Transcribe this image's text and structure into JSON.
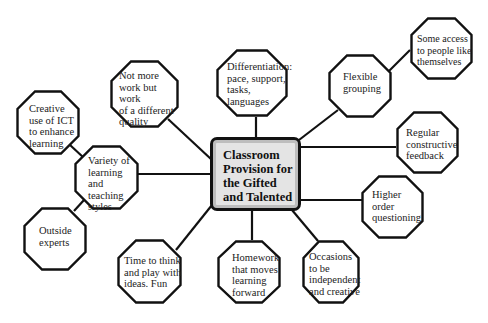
{
  "diagram": {
    "type": "mind-map",
    "center": {
      "lines": [
        "Classroom",
        "Provision for",
        "the Gifted",
        "and Talented"
      ]
    },
    "nodes": [
      {
        "id": "not-more-work",
        "lines": [
          "Not more",
          "work but work",
          "of a different",
          "quality"
        ]
      },
      {
        "id": "differentiation",
        "lines": [
          "Differentiation:",
          "pace, support,",
          "tasks,",
          "languages"
        ]
      },
      {
        "id": "flexible-grouping",
        "lines": [
          "Flexible",
          "grouping"
        ]
      },
      {
        "id": "some-access",
        "lines": [
          "Some access",
          "to people like",
          "themselves"
        ]
      },
      {
        "id": "regular-feedback",
        "lines": [
          "Regular",
          "constructive",
          "feedback"
        ]
      },
      {
        "id": "higher-order",
        "lines": [
          "Higher",
          "order",
          "questioning"
        ]
      },
      {
        "id": "occasions",
        "lines": [
          "Occasions",
          "to be",
          "independent",
          "and creative"
        ]
      },
      {
        "id": "homework",
        "lines": [
          "Homework",
          "that moves",
          "learning",
          "forward"
        ]
      },
      {
        "id": "time-to-think",
        "lines": [
          "Time to think",
          "and play with",
          "ideas. Fun"
        ]
      },
      {
        "id": "variety",
        "lines": [
          "Variety of",
          "learning and",
          "teaching",
          "styles"
        ]
      },
      {
        "id": "creative-ict",
        "lines": [
          "Creative",
          "use of ICT",
          "to enhance",
          "learning"
        ]
      },
      {
        "id": "outside-experts",
        "lines": [
          "Outside",
          "experts"
        ]
      }
    ],
    "connections": [
      [
        "center",
        "not-more-work"
      ],
      [
        "center",
        "differentiation"
      ],
      [
        "center",
        "flexible-grouping"
      ],
      [
        "flexible-grouping",
        "some-access"
      ],
      [
        "center",
        "regular-feedback"
      ],
      [
        "center",
        "higher-order"
      ],
      [
        "center",
        "occasions"
      ],
      [
        "center",
        "homework"
      ],
      [
        "center",
        "time-to-think"
      ],
      [
        "center",
        "variety"
      ],
      [
        "variety",
        "creative-ict"
      ],
      [
        "variety",
        "outside-experts"
      ]
    ]
  }
}
